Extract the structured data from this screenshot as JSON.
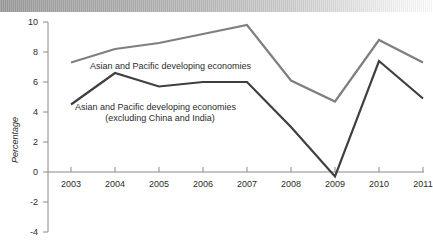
{
  "chart_data": {
    "type": "line",
    "title": "",
    "subtitle": "",
    "xlabel": "",
    "ylabel": "Percentage",
    "categories": [
      "2003",
      "2004",
      "2005",
      "2006",
      "2007",
      "2008",
      "2009",
      "2010",
      "2011"
    ],
    "x": [
      2003,
      2004,
      2005,
      2006,
      2007,
      2008,
      2009,
      2010,
      2011
    ],
    "xlim": [
      2003,
      2011
    ],
    "ylim": [
      -4,
      10
    ],
    "yticks": [
      10,
      8,
      6,
      4,
      2,
      0,
      -2,
      -4
    ],
    "ytick_labels": [
      "10",
      "8",
      "6",
      "4",
      "2",
      "0",
      "-2",
      "-4"
    ],
    "grid": false,
    "legend_position": "inline-annotations",
    "series": [
      {
        "name": "Asian and Pacific developing economies",
        "color": "#7f7f7f",
        "stroke_width": 2.2,
        "values": [
          7.3,
          8.2,
          8.6,
          9.2,
          9.8,
          6.1,
          4.7,
          8.8,
          7.3
        ],
        "annotation": "Asian and Pacific developing economies",
        "annotation_lines": [
          "Asian and Pacific developing economies"
        ]
      },
      {
        "name": "Asian and Pacific developing economies (excluding China and India)",
        "color": "#3f3f3f",
        "stroke_width": 2.2,
        "values": [
          4.5,
          6.6,
          5.7,
          6.0,
          6.0,
          3.0,
          -0.3,
          7.4,
          4.9
        ],
        "annotation": "Asian and Pacific developing economies (excluding China and India)",
        "annotation_lines": [
          "Asian and Pacific developing economies",
          "(excluding China and India)"
        ]
      }
    ],
    "axis_color": "#8a8a8a",
    "background_color": "#ffffff"
  },
  "banner": {
    "name": "scan-banner"
  }
}
